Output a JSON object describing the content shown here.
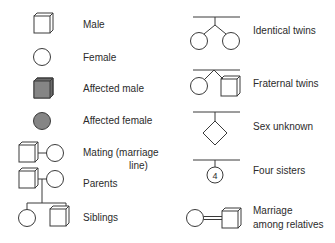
{
  "colors": {
    "stroke": "#3a3a3a",
    "affected_fill": "#858585",
    "text": "#2b2b2b",
    "background": "#ffffff"
  },
  "left_column": [
    {
      "id": "male",
      "symbol": "square",
      "label": "Male"
    },
    {
      "id": "female",
      "symbol": "circle",
      "label": "Female"
    },
    {
      "id": "affected-male",
      "symbol": "filled-square",
      "label": "Affected male"
    },
    {
      "id": "affected-female",
      "symbol": "filled-circle",
      "label": "Affected female"
    },
    {
      "id": "mating",
      "symbol": "square-line-circle",
      "label_line1": "Mating (marriage",
      "label_line2": "line)"
    },
    {
      "id": "parents",
      "symbol": "square-line-circle-descent",
      "label": "Parents"
    },
    {
      "id": "siblings",
      "symbol": "sibship-circle-square",
      "label": "Siblings"
    }
  ],
  "right_column": [
    {
      "id": "identical-twins",
      "symbol": "twin-circles-joined",
      "label": "Identical twins"
    },
    {
      "id": "fraternal-twins",
      "symbol": "twin-circle-square",
      "label": "Fraternal twins"
    },
    {
      "id": "sex-unknown",
      "symbol": "diamond",
      "label": "Sex unknown"
    },
    {
      "id": "four-sisters",
      "symbol": "circle-with-number",
      "number": "4",
      "label": "Four sisters"
    },
    {
      "id": "consanguineous-marriage",
      "symbol": "circle-double-line-square",
      "label_line1": "Marriage",
      "label_line2": "among relatives"
    }
  ]
}
